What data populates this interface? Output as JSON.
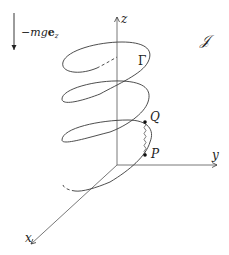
{
  "figure": {
    "type": "3d-helix-diagram",
    "stroke_color": "#3a3a3a",
    "background": "#ffffff"
  },
  "labels": {
    "force": {
      "prefix": "−mg",
      "vector": "e",
      "subscript": "z"
    },
    "z_axis": "z",
    "y_axis": "y",
    "x_axis": "x",
    "curve": "Γ",
    "frame": "𝒥",
    "point_q": "Q",
    "point_p": "P"
  },
  "geometry": {
    "origin": [
      117,
      165
    ],
    "z_axis_tip": [
      117,
      16
    ],
    "y_axis_tip": [
      218,
      165
    ],
    "x_axis_tip": [
      30,
      245
    ],
    "point_q": [
      145,
      122
    ],
    "point_p": [
      145,
      155
    ],
    "helix_turns": 3
  }
}
